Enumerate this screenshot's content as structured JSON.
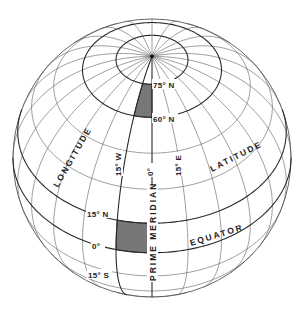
{
  "diagram": {
    "projection": {
      "type": "orthographic",
      "center_x": 152,
      "center_y": 158,
      "radius": 139,
      "tilt_deg": 43,
      "center_lon_deg": 0,
      "graticule_step_deg": 15
    },
    "colors": {
      "line": "#5a5a5a",
      "major_line": "#2a2a2a",
      "shade": "#777777",
      "text": "#222222",
      "background": "#ffffff"
    },
    "major_parallels_deg": [
      0,
      15,
      60,
      75
    ],
    "shaded_regions": [
      {
        "name": "cell-60N-75N-15W-0",
        "lat_min": 60,
        "lat_max": 75,
        "lon_min": -15,
        "lon_max": 0
      },
      {
        "name": "cell-0-15N-15W-0",
        "lat_min": 0,
        "lat_max": 15,
        "lon_min": -15,
        "lon_max": 0
      }
    ],
    "labels": {
      "lat_75n": "75° N",
      "lat_60n": "60° N",
      "lat_15n": "15° N",
      "lat_0": "0°",
      "lat_15s": "15° S",
      "lon_15w": "15° W",
      "lon_0": "0°",
      "lon_15e": "15° E",
      "longitude": "LONGITUDE",
      "latitude": "LATITUDE",
      "equator": "EQUATOR",
      "prime_meridian": "PRIME MERIDIAN"
    }
  }
}
